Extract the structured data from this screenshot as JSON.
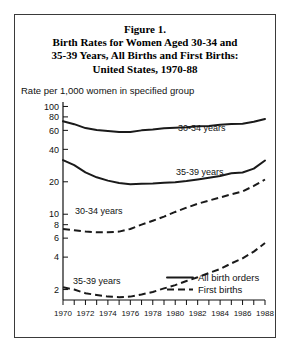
{
  "figure": {
    "title_lines": [
      "Figure 1.",
      "Birth Rates for Women Aged 30-34 and",
      "35-39 Years, All Births and First Births:",
      "United States, 1970-88"
    ],
    "axis_subtitle": "Rate per 1,000 women in specified group"
  },
  "legend": {
    "position": "bottom-right",
    "items": [
      {
        "label": "All birth orders",
        "style": "solid"
      },
      {
        "label": "First births",
        "style": "dashed"
      }
    ]
  },
  "inline_labels": [
    {
      "text": "30-34 years",
      "series": "30-34 all birth orders"
    },
    {
      "text": "35-39 years",
      "series": "35-39 all birth orders"
    },
    {
      "text": "30-34 years",
      "series": "30-34 first births"
    },
    {
      "text": "35-39 years",
      "series": "35-39 first births"
    }
  ],
  "chart_data": {
    "type": "line",
    "title": "Birth Rates for Women Aged 30-34 and 35-39 Years, All Births and First Births: United States, 1970-88",
    "xlabel": "",
    "ylabel": "Rate per 1,000 women in specified group",
    "yscale": "log",
    "ylim": [
      1.6,
      110
    ],
    "xlim": [
      1970,
      1988
    ],
    "grid": false,
    "ytick_labels": [
      "100",
      "80",
      "60",
      "40",
      "20",
      "10",
      "8",
      "6",
      "4",
      "2"
    ],
    "ytick_values": [
      100,
      80,
      60,
      40,
      20,
      10,
      8,
      6,
      4,
      2
    ],
    "x": [
      1970,
      1971,
      1972,
      1973,
      1974,
      1975,
      1976,
      1977,
      1978,
      1979,
      1980,
      1981,
      1982,
      1983,
      1984,
      1985,
      1986,
      1987,
      1988
    ],
    "xtick_labels": [
      "1970",
      "1972",
      "1974",
      "1976",
      "1978",
      "1980",
      "1982",
      "1984",
      "1986",
      "1988"
    ],
    "xtick_label_values": [
      1970,
      1972,
      1974,
      1976,
      1978,
      1980,
      1982,
      1984,
      1986,
      1988
    ],
    "xtick_minor_every": 1,
    "series": [
      {
        "name": "30-34 years, all birth orders",
        "style": "solid",
        "values": [
          73.0,
          68.5,
          63.0,
          60.5,
          59.3,
          58.1,
          58.0,
          60.0,
          61.0,
          62.8,
          63.5,
          64.0,
          65.5,
          66.0,
          67.5,
          68.8,
          69.2,
          72.0,
          76.5
        ]
      },
      {
        "name": "35-39 years, all birth orders",
        "style": "solid",
        "values": [
          31.8,
          28.5,
          24.5,
          22.0,
          20.5,
          19.5,
          19.0,
          19.2,
          19.3,
          19.6,
          19.8,
          20.3,
          21.0,
          21.8,
          22.6,
          24.0,
          24.4,
          26.5,
          31.5
        ]
      },
      {
        "name": "30-34 years, first births",
        "style": "dashed",
        "values": [
          7.3,
          7.1,
          6.9,
          6.8,
          6.8,
          6.9,
          7.3,
          8.0,
          8.7,
          9.5,
          10.5,
          11.5,
          12.5,
          13.4,
          14.3,
          15.3,
          16.3,
          18.3,
          21.0
        ]
      },
      {
        "name": "35-39 years, first births",
        "style": "dashed",
        "values": [
          2.1,
          2.0,
          1.85,
          1.78,
          1.72,
          1.7,
          1.72,
          1.8,
          1.9,
          2.05,
          2.2,
          2.4,
          2.6,
          2.85,
          3.1,
          3.5,
          3.9,
          4.5,
          5.4
        ]
      }
    ]
  }
}
